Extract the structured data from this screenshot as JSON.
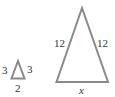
{
  "diagram": {
    "stroke_color": "#8a8a8a",
    "small_triangle": {
      "left_side": "3",
      "right_side": "3",
      "base": "2"
    },
    "large_triangle": {
      "left_side": "12",
      "right_side": "12",
      "base": "x"
    }
  }
}
